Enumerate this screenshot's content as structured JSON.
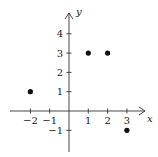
{
  "chart_data": {
    "type": "scatter",
    "title": "",
    "xlabel": "x",
    "ylabel": "y",
    "xlim": [
      -3,
      4
    ],
    "ylim": [
      -2,
      5
    ],
    "grid": false,
    "x_ticks": [
      -2,
      -1,
      1,
      2,
      3
    ],
    "y_ticks": [
      -1,
      1,
      2,
      3,
      4
    ],
    "x_tick_labels": [
      "−2",
      "−1",
      "1",
      "2",
      "3"
    ],
    "y_tick_labels": [
      "−1",
      "1",
      "2",
      "3",
      "4"
    ],
    "series": [
      {
        "name": "points",
        "points": [
          {
            "x": -2,
            "y": 1
          },
          {
            "x": 1,
            "y": 3
          },
          {
            "x": 2,
            "y": 3
          },
          {
            "x": 3,
            "y": -1
          }
        ]
      }
    ]
  },
  "axes": {
    "x_label": "x",
    "y_label": "y"
  },
  "colors": {
    "axis": "#333333",
    "point": "#111111"
  }
}
